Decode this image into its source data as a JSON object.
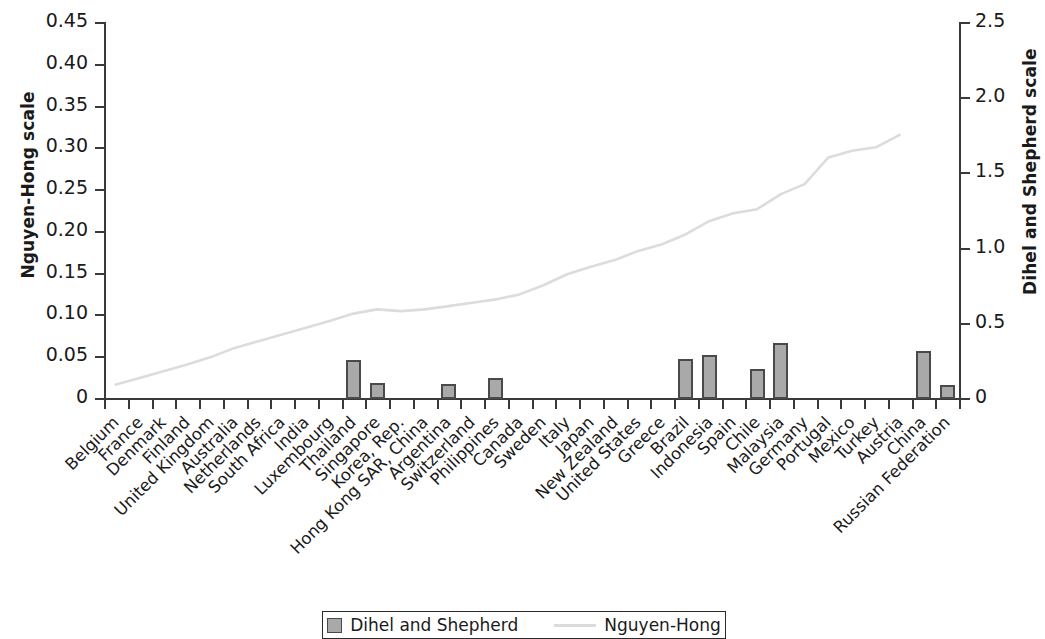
{
  "chart_data": {
    "type": "bar",
    "title": "",
    "xlabel": "",
    "ylabel": "Nguyen-Hong scale",
    "y2label": "Dihel and Shepherd scale",
    "ylim": [
      0,
      0.45
    ],
    "y2lim": [
      0,
      2.5
    ],
    "yticks": [
      "0",
      "0.05",
      "0.10",
      "0.15",
      "0.20",
      "0.25",
      "0.30",
      "0.35",
      "0.40",
      "0.45"
    ],
    "ytick_values": [
      0,
      0.05,
      0.1,
      0.15,
      0.2,
      0.25,
      0.3,
      0.35,
      0.4,
      0.45
    ],
    "y2ticks": [
      "0",
      "0.5",
      "1.0",
      "1.5",
      "2.0",
      "2.5"
    ],
    "y2tick_values": [
      0,
      0.5,
      1.0,
      1.5,
      2.0,
      2.5
    ],
    "grid": false,
    "legend_position": "bottom",
    "categories": [
      "Belgium",
      "France",
      "Denmark",
      "Finland",
      "United Kingdom",
      "Australia",
      "Netherlands",
      "South Africa",
      "India",
      "Luxembourg",
      "Thailand",
      "Singapore",
      "Korea, Rep.",
      "Hong Kong SAR, China",
      "Argentina",
      "Switzerland",
      "Philippines",
      "Canada",
      "Sweden",
      "Italy",
      "Japan",
      "New Zealand",
      "United States",
      "Greece",
      "Brazil",
      "Indonesia",
      "Spain",
      "Chile",
      "Malaysia",
      "Germany",
      "Portugal",
      "Mexico",
      "Turkey",
      "Austria",
      "China",
      "Russian Federation"
    ],
    "series": [
      {
        "name": "Dihel and Shepherd",
        "axis": "right",
        "render": "bar",
        "color": "#a9a9a9",
        "edge_color": "#4a4a4a",
        "values": [
          null,
          null,
          null,
          null,
          null,
          null,
          null,
          null,
          null,
          null,
          0.25,
          0.102,
          null,
          null,
          0.094,
          null,
          0.133,
          null,
          null,
          null,
          null,
          null,
          null,
          null,
          0.256,
          0.283,
          null,
          0.19,
          0.364,
          null,
          null,
          null,
          null,
          null,
          0.311,
          0.088
        ]
      },
      {
        "name": "Nguyen-Hong",
        "axis": "left",
        "render": "line",
        "color": "#dcdcdc",
        "values": [
          0.016,
          0.024,
          0.032,
          0.04,
          0.049,
          0.06,
          0.068,
          0.076,
          0.084,
          0.092,
          0.101,
          0.106,
          0.104,
          0.106,
          0.11,
          0.114,
          0.118,
          0.124,
          0.135,
          0.148,
          0.157,
          0.165,
          0.176,
          0.184,
          0.196,
          0.212,
          0.221,
          0.226,
          0.244,
          0.256,
          0.288,
          0.296,
          0.3,
          0.315,
          null,
          null
        ]
      }
    ]
  },
  "legend": {
    "items": [
      {
        "label": "Dihel and Shepherd",
        "marker": "square-swatch"
      },
      {
        "label": "Nguyen-Hong",
        "marker": "line-swatch"
      }
    ]
  }
}
